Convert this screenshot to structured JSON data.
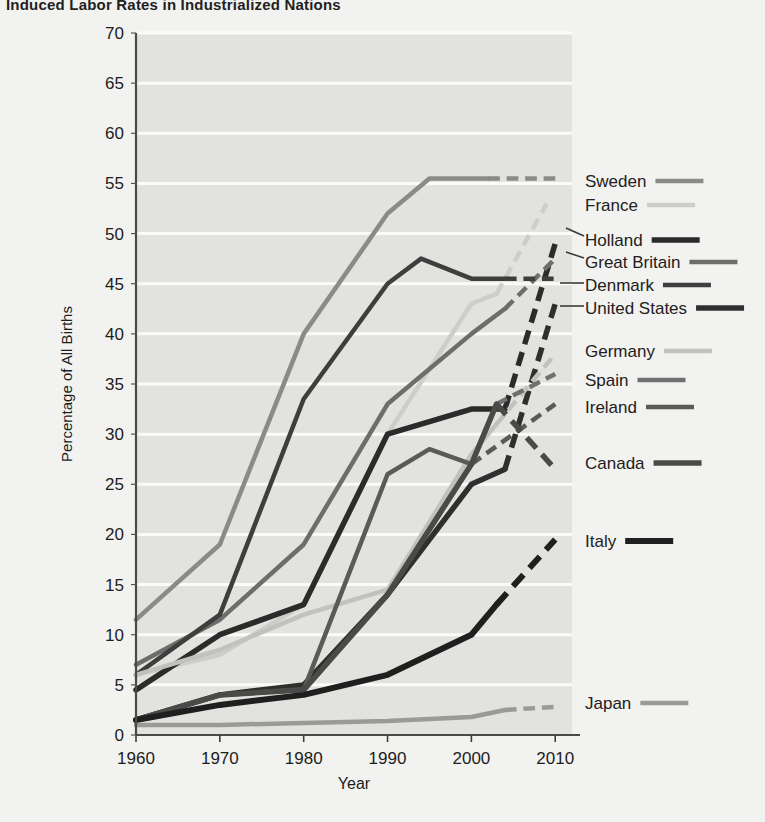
{
  "title": "Induced Labor Rates in Industrialized Nations",
  "axes": {
    "ylabel": "Percentage of All Births",
    "xlabel": "Year",
    "yticks": [
      0,
      5,
      10,
      15,
      20,
      25,
      30,
      35,
      40,
      45,
      50,
      55,
      60,
      65,
      70
    ],
    "xticks": [
      1960,
      1970,
      1980,
      1990,
      2000,
      2010
    ]
  },
  "legend": [
    {
      "name": "Sweden",
      "color": "#8a8a88",
      "width": 4.5,
      "y": 181
    },
    {
      "name": "France",
      "color": "#cdcdc9",
      "width": 4.5,
      "y": 205
    },
    {
      "name": "Holland",
      "color": "#2b2b2b",
      "width": 5.5,
      "y": 240
    },
    {
      "name": "Great Britain",
      "color": "#6d6d6b",
      "width": 4.5,
      "y": 262
    },
    {
      "name": "Denmark",
      "color": "#3e3e3e",
      "width": 4.5,
      "y": 285
    },
    {
      "name": "United States",
      "color": "#2f2f2f",
      "width": 5.5,
      "y": 308
    },
    {
      "name": "Germany",
      "color": "#c2c2bd",
      "width": 4.5,
      "y": 351
    },
    {
      "name": "Spain",
      "color": "#707070",
      "width": 4.5,
      "y": 380
    },
    {
      "name": "Ireland",
      "color": "#5a5a58",
      "width": 4.5,
      "y": 407
    },
    {
      "name": "Canada",
      "color": "#4a4a48",
      "width": 5.5,
      "y": 463
    },
    {
      "name": "Italy",
      "color": "#1f1f1f",
      "width": 6.0,
      "y": 541
    },
    {
      "name": "Japan",
      "color": "#9a9a96",
      "width": 4.5,
      "y": 703
    }
  ],
  "chart_data": {
    "type": "line",
    "title": "Induced Labor Rates in Industrialized Nations",
    "xlabel": "Year",
    "ylabel": "Percentage of All Births",
    "xlim": [
      1960,
      2012
    ],
    "ylim": [
      0,
      70
    ],
    "grid": true,
    "legend_position": "right",
    "note": "Solid segments are observed data; dashed segments are projections.",
    "series": [
      {
        "name": "Sweden",
        "color": "#8a8a88",
        "solid": {
          "x": [
            1960,
            1970,
            1980,
            1990,
            1995,
            2002
          ],
          "y": [
            11.5,
            19,
            40,
            52,
            55.5,
            55.5
          ]
        },
        "dashed": {
          "x": [
            2002,
            2010
          ],
          "y": [
            55.5,
            55.5
          ]
        }
      },
      {
        "name": "France",
        "color": "#cdcdc9",
        "solid": {
          "x": [
            1960,
            1970,
            1980,
            1990,
            2000,
            2003
          ],
          "y": [
            6,
            8,
            13,
            30,
            43,
            44
          ]
        },
        "dashed": {
          "x": [
            2003,
            2009
          ],
          "y": [
            44,
            53
          ]
        }
      },
      {
        "name": "Holland",
        "color": "#2b2b2b",
        "solid": {
          "x": [
            1960,
            1970,
            1980,
            1990,
            2000,
            2004
          ],
          "y": [
            4.5,
            10,
            13,
            30,
            32.5,
            32.5
          ]
        },
        "dashed": {
          "x": [
            2004,
            2010
          ],
          "y": [
            32.5,
            49
          ]
        }
      },
      {
        "name": "Great Britain",
        "color": "#6d6d6b",
        "solid": {
          "x": [
            1960,
            1970,
            1980,
            1990,
            2000,
            2004
          ],
          "y": [
            7,
            11.5,
            19,
            33,
            40,
            42.5
          ]
        },
        "dashed": {
          "x": [
            2004,
            2010
          ],
          "y": [
            42.5,
            47.5
          ]
        }
      },
      {
        "name": "Denmark",
        "color": "#3e3e3e",
        "solid": {
          "x": [
            1960,
            1970,
            1980,
            1990,
            1994,
            2000,
            2004
          ],
          "y": [
            6,
            12,
            33.5,
            45,
            47.5,
            45.5,
            45.5
          ]
        },
        "dashed": {
          "x": [
            2004,
            2010
          ],
          "y": [
            45.5,
            45.5
          ]
        }
      },
      {
        "name": "United States",
        "color": "#2f2f2f",
        "solid": {
          "x": [
            1960,
            1970,
            1980,
            1990,
            2000,
            2004
          ],
          "y": [
            1.5,
            4,
            5,
            14,
            25,
            26.5
          ]
        },
        "dashed": {
          "x": [
            2004,
            2010
          ],
          "y": [
            26.5,
            43
          ]
        }
      },
      {
        "name": "Germany",
        "color": "#c2c2bd",
        "solid": {
          "x": [
            1960,
            1970,
            1980,
            1990,
            2000,
            2003
          ],
          "y": [
            6,
            8.5,
            12,
            14.5,
            28,
            31
          ]
        },
        "dashed": {
          "x": [
            2003,
            2010
          ],
          "y": [
            31,
            38
          ]
        }
      },
      {
        "name": "Spain",
        "color": "#707070",
        "solid": {
          "x": [
            1960,
            1970,
            1980,
            1990,
            2000,
            2003
          ],
          "y": [
            1.5,
            4,
            4.5,
            14,
            27,
            33
          ]
        },
        "dashed": {
          "x": [
            2003,
            2010
          ],
          "y": [
            33,
            36
          ]
        }
      },
      {
        "name": "Ireland",
        "color": "#5a5a58",
        "solid": {
          "x": [
            1960,
            1970,
            1980,
            1990,
            1995,
            2000
          ],
          "y": [
            1.5,
            4,
            4.5,
            26,
            28.5,
            27
          ]
        },
        "dashed": {
          "x": [
            2000,
            2010
          ],
          "y": [
            27,
            33
          ]
        }
      },
      {
        "name": "Canada",
        "color": "#4a4a48",
        "solid": {
          "x": [
            1960,
            1970,
            1980,
            1990,
            2000,
            2003
          ],
          "y": [
            1.5,
            4,
            4.5,
            14,
            27,
            33
          ]
        },
        "dashed": {
          "x": [
            2003,
            2010
          ],
          "y": [
            33,
            26.5
          ]
        }
      },
      {
        "name": "Italy",
        "color": "#1f1f1f",
        "solid": {
          "x": [
            1960,
            1970,
            1980,
            1990,
            2000,
            2003
          ],
          "y": [
            1.5,
            3,
            4,
            6,
            10,
            13
          ]
        },
        "dashed": {
          "x": [
            2003,
            2010
          ],
          "y": [
            13,
            19.5
          ]
        }
      },
      {
        "name": "Japan",
        "color": "#9a9a96",
        "solid": {
          "x": [
            1960,
            1970,
            1980,
            1990,
            2000,
            2004
          ],
          "y": [
            1,
            1,
            1.2,
            1.4,
            1.8,
            2.5
          ]
        },
        "dashed": {
          "x": [
            2004,
            2010
          ],
          "y": [
            2.5,
            2.8
          ]
        }
      }
    ]
  }
}
